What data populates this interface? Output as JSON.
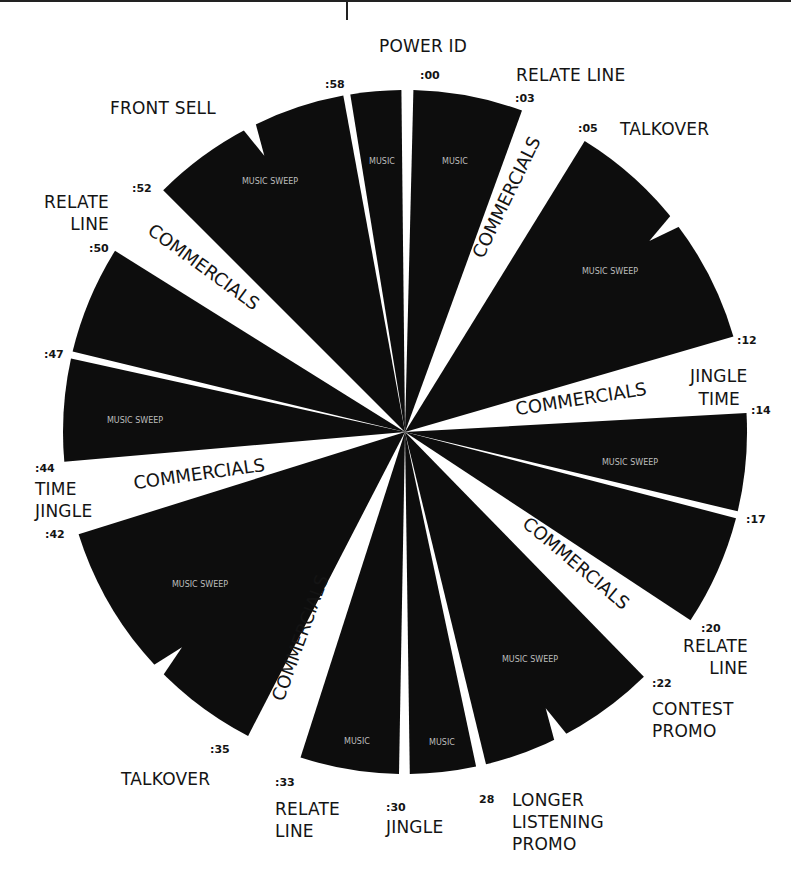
{
  "colors": {
    "wedge": "#0d0d0d",
    "gap": "#ffffff",
    "text": "#141414",
    "inner_text": "#bdbdbd"
  },
  "clock": {
    "center": [
      405,
      432
    ],
    "radius": 342,
    "wedges": [
      {
        "id": "m58-00",
        "start": -9.2,
        "end": -0.6,
        "type": "music",
        "inner": "MUSIC"
      },
      {
        "id": "m00-03",
        "start": 1.4,
        "end": 20.0,
        "type": "music",
        "inner": "MUSIC"
      },
      {
        "id": "m05-12",
        "start": 31.7,
        "end": 73.8,
        "type": "music",
        "inner": "MUSIC SWEEP",
        "notch": 52
      },
      {
        "id": "m14-17",
        "start": 86.8,
        "end": 103.4,
        "type": "music",
        "inner": "MUSIC SWEEP"
      },
      {
        "id": "m17-20",
        "start": 104.6,
        "end": 123.4,
        "type": "music",
        "inner": ""
      },
      {
        "id": "m22-28",
        "start": 135.7,
        "end": 166.3,
        "type": "music",
        "inner": "MUSIC SWEEP",
        "notch": 153
      },
      {
        "id": "m28-30",
        "start": 168.0,
        "end": 179.2,
        "type": "music",
        "inner": "MUSIC"
      },
      {
        "id": "m30-33",
        "start": 181.0,
        "end": 197.8,
        "type": "music",
        "inner": "MUSIC"
      },
      {
        "id": "m35-42",
        "start": 207.3,
        "end": 252.6,
        "type": "music",
        "inner": "MUSIC SWEEP",
        "notch": 226
      },
      {
        "id": "m44-47",
        "start": 265.0,
        "end": 282.4,
        "type": "music",
        "inner": "MUSIC SWEEP"
      },
      {
        "id": "m47-50",
        "start": 283.6,
        "end": 302.0,
        "type": "music",
        "inner": ""
      },
      {
        "id": "m52-58",
        "start": 315.0,
        "end": 349.6,
        "type": "music",
        "inner": "MUSIC SWEEP",
        "notch": 333
      }
    ],
    "commercial_bands": [
      {
        "id": "c03-05",
        "label": "COMMERCIALS"
      },
      {
        "id": "c12-14",
        "label": "COMMERCIALS"
      },
      {
        "id": "c20-22",
        "label": "COMMERCIALS"
      },
      {
        "id": "c33-35",
        "label": "COMMERCIALS"
      },
      {
        "id": "c42-44",
        "label": "COMMERCIALS"
      },
      {
        "id": "c50-52",
        "label": "COMMERCIALS"
      }
    ]
  },
  "times": {
    "t00": ":00",
    "t03": ":03",
    "t05": ":05",
    "t12": ":12",
    "t14": ":14",
    "t17": ":17",
    "t20": ":20",
    "t22": ":22",
    "t28": "28",
    "t30": ":30",
    "t33": ":33",
    "t35": ":35",
    "t42": ":42",
    "t44": ":44",
    "t47": ":47",
    "t50": ":50",
    "t52": ":52",
    "t58": ":58"
  },
  "labels": {
    "power_id": "POWER ID",
    "relate_line_top": "RELATE LINE",
    "talkover_top": "TALKOVER",
    "jingle_time_1": "JINGLE",
    "jingle_time_2": "TIME",
    "relate_line_20_1": "RELATE",
    "relate_line_20_2": "LINE",
    "contest_promo_1": "CONTEST",
    "contest_promo_2": "PROMO",
    "longer_listening_1": "LONGER",
    "longer_listening_2": "LISTENING",
    "longer_listening_3": "PROMO",
    "jingle_30": "JINGLE",
    "relate_line_33_1": "RELATE",
    "relate_line_33_2": "LINE",
    "talkover_35": "TALKOVER",
    "time_jingle_1": "TIME",
    "time_jingle_2": "JINGLE",
    "relate_line_50_1": "RELATE",
    "relate_line_50_2": "LINE",
    "front_sell": "FRONT SELL"
  },
  "commercial_text": {
    "c03": "COMMERCIALS",
    "c12": "COMMERCIALS",
    "c20": "COMMERCIALS",
    "c33": "COMMERCIALS",
    "c42": "COMMERCIALS",
    "c50": "COMMERCIALS"
  },
  "inner_text": {
    "w58": "MUSIC",
    "w00": "MUSIC",
    "w05": "MUSIC SWEEP",
    "w14": "MUSIC SWEEP",
    "w22": "MUSIC SWEEP",
    "w28": "MUSIC",
    "w30": "MUSIC",
    "w35": "MUSIC SWEEP",
    "w44": "MUSIC SWEEP",
    "w52": "MUSIC SWEEP"
  }
}
